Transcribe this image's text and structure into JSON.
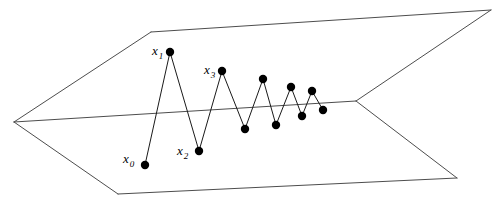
{
  "figure": {
    "background_color": "#ffffff",
    "width": 502,
    "height": 213
  },
  "style": {
    "plane_edge_color": "#4d4d4d",
    "path_color": "#1a1a1a",
    "dot_color": "#000000",
    "label_color": "#000000",
    "dot_radius": 4.2,
    "line_width": 1
  },
  "plane": {
    "name": "perspective-plane",
    "description": "Two quadrilateral faces sharing a central horizon line, drawn as a folded plane in perspective",
    "vertices": {
      "left_apex": [
        14,
        122
      ],
      "top_left": [
        151,
        32
      ],
      "top_right": [
        491,
        10
      ],
      "right_apex": [
        356,
        101
      ],
      "bottom_right": [
        457,
        178
      ],
      "bottom_left": [
        118,
        194
      ]
    },
    "edges": [
      {
        "name": "upper-left-edge",
        "from": "left_apex",
        "to": "top_left"
      },
      {
        "name": "upper-top-edge",
        "from": "top_left",
        "to": "top_right"
      },
      {
        "name": "upper-right-edge",
        "from": "top_right",
        "to": "right_apex"
      },
      {
        "name": "horizon-edge",
        "from": "right_apex",
        "to": "left_apex"
      },
      {
        "name": "lower-left-edge",
        "from": "left_apex",
        "to": "bottom_left"
      },
      {
        "name": "lower-bottom-edge",
        "from": "bottom_left",
        "to": "bottom_right"
      },
      {
        "name": "lower-right-edge",
        "from": "bottom_right",
        "to": "right_apex"
      }
    ]
  },
  "chart_data": {
    "type": "line",
    "xlabel": "",
    "ylabel": "",
    "grid": false,
    "legend": null,
    "series": [
      {
        "name": "iterate-path",
        "marker": "filled-circle",
        "points": [
          {
            "index": 0,
            "label": "x",
            "subscript": "0",
            "x": 145,
            "y": 165,
            "labeled": true
          },
          {
            "index": 1,
            "label": "x",
            "subscript": "1",
            "x": 170,
            "y": 52,
            "labeled": true
          },
          {
            "index": 2,
            "label": "x",
            "subscript": "2",
            "x": 199,
            "y": 151,
            "labeled": true
          },
          {
            "index": 3,
            "label": "x",
            "subscript": "3",
            "x": 222,
            "y": 71,
            "labeled": true
          },
          {
            "index": 4,
            "label": "x",
            "subscript": "4",
            "x": 245,
            "y": 129,
            "labeled": false
          },
          {
            "index": 5,
            "label": "x",
            "subscript": "5",
            "x": 263,
            "y": 79,
            "labeled": false
          },
          {
            "index": 6,
            "label": "x",
            "subscript": "6",
            "x": 276,
            "y": 125,
            "labeled": false
          },
          {
            "index": 7,
            "label": "x",
            "subscript": "7",
            "x": 291,
            "y": 87,
            "labeled": false
          },
          {
            "index": 8,
            "label": "x",
            "subscript": "8",
            "x": 302,
            "y": 116,
            "labeled": false
          },
          {
            "index": 9,
            "label": "x",
            "subscript": "9",
            "x": 312,
            "y": 91,
            "labeled": false
          },
          {
            "index": 10,
            "label": "x",
            "subscript": "10",
            "x": 323,
            "y": 110,
            "labeled": false
          }
        ]
      }
    ],
    "annotations": [
      {
        "name": "label-x0",
        "text": "x",
        "subscript": "0",
        "x": 123,
        "y": 163
      },
      {
        "name": "label-x1",
        "text": "x",
        "subscript": "1",
        "x": 152,
        "y": 55
      },
      {
        "name": "label-x2",
        "text": "x",
        "subscript": "2",
        "x": 177,
        "y": 155
      },
      {
        "name": "label-x3",
        "text": "x",
        "subscript": "3",
        "x": 204,
        "y": 74
      }
    ]
  }
}
